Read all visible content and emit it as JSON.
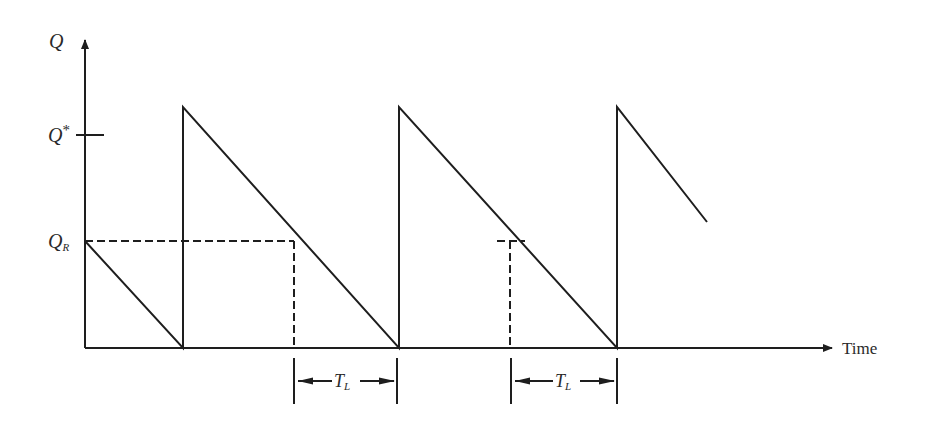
{
  "figure": {
    "y_axis": {
      "label": "Q",
      "ticks": [
        {
          "label": "Q*",
          "main": "Q",
          "sup": "*",
          "y": 135
        },
        {
          "label": "Q_R",
          "main": "Q",
          "sub": "R",
          "y": 241
        }
      ]
    },
    "x_axis": {
      "label": "Time"
    },
    "lead_time": [
      {
        "label": "T_L",
        "main": "T",
        "sub": "L"
      },
      {
        "label": "T_L",
        "main": "T",
        "sub": "L"
      }
    ],
    "colors": {
      "line": "#1e1e1e",
      "text": "#2a2a2a"
    }
  }
}
